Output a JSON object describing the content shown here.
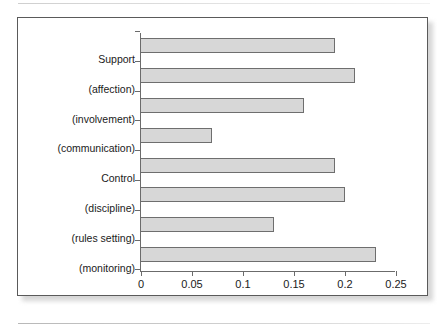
{
  "figure": {
    "frame_color": "#5a5a5a",
    "bar_fill": "#d7d7d7",
    "bar_stroke": "#6e6e6e",
    "axis_color": "#6b6b6b"
  },
  "chart_data": {
    "type": "bar",
    "orientation": "horizontal",
    "title": "",
    "xlabel": "",
    "ylabel": "",
    "xlim": [
      0,
      0.25
    ],
    "grid": false,
    "legend": null,
    "xticks": [
      "0",
      "0.05",
      "0.1",
      "0.15",
      "0.2",
      "0.25"
    ],
    "xtick_values": [
      0,
      0.05,
      0.1,
      0.15,
      0.2,
      0.25
    ],
    "categories": [
      "Support",
      "(affection)",
      "(involvement)",
      "(communication)",
      "Control",
      "(discipline)",
      "(rules setting)",
      "(monitoring)"
    ],
    "values": [
      0.19,
      0.21,
      0.16,
      0.07,
      0.19,
      0.2,
      0.13,
      0.23
    ]
  }
}
